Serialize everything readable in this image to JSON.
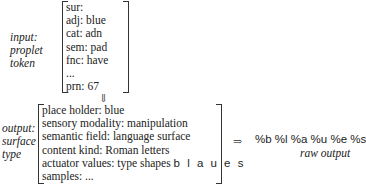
{
  "input": {
    "label_lines": [
      "input:",
      "proplet",
      "token"
    ],
    "features": [
      "sur:",
      "adj: blue",
      "cat: adn",
      "sem: pad",
      "fnc: have",
      "...",
      "prn: 67"
    ]
  },
  "down_arrow": "⇓",
  "output": {
    "label_lines": [
      "output:",
      "surface",
      "type"
    ],
    "features": [
      {
        "text": "place holder: blue"
      },
      {
        "text": "sensory modality: manipulation"
      },
      {
        "text": "semantic field: language surface"
      },
      {
        "text": "content kind: Roman letters"
      },
      {
        "text": "actuator values: type shapes ",
        "sans": "b l a u e s"
      },
      {
        "text": "samples: ..."
      }
    ]
  },
  "right_arrow": "⇒",
  "raw_output": {
    "value": "%b %l %a %u %e %s",
    "label": "raw output"
  }
}
